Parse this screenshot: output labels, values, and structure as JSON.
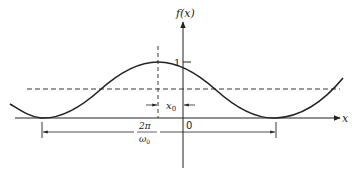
{
  "diagram": {
    "type": "periodic function plot",
    "y_axis_label": "f(x)",
    "x_axis_label": "x",
    "tick_one_label": "1",
    "origin_label": "0",
    "offset_label": "x",
    "offset_subscript": "0",
    "period_numerator": "2π",
    "period_denominator_main": "ω",
    "period_denominator_sub": "0",
    "colors": {
      "stroke": "#222222",
      "background": "#ffffff"
    }
  }
}
